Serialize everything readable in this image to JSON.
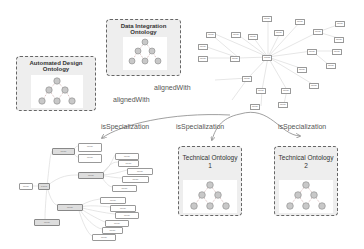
{
  "ontologies": {
    "automated_design": {
      "title": "Automated Design Ontology"
    },
    "data_integration": {
      "title": "Data Integration Ontology"
    },
    "technical_1": {
      "title_line1": "Technical Ontology",
      "title_line2": "1"
    },
    "technical_2": {
      "title_line1": "Technical Ontology",
      "title_line2": "2"
    }
  },
  "relations": {
    "aligned_with_1": "alignedWith",
    "aligned_with_2": "alignedWith",
    "is_specialization_1": "isSpecialization",
    "is_specialization_2": "isSpecialization",
    "is_specialization_3": "isSpecialization"
  },
  "graph": {
    "center": "Thing",
    "nodes": [
      "Node",
      "Node",
      "Node",
      "Node",
      "Node",
      "Node",
      "Node",
      "Node",
      "Node",
      "Node",
      "Node",
      "Node",
      "Node",
      "Node",
      "Node",
      "Node",
      "Node",
      "Node",
      "Node",
      "Node",
      "Node",
      "Node"
    ]
  },
  "tree": {
    "root": "Thing",
    "nodes": [
      "Node",
      "Node",
      "Node",
      "Node",
      "Node",
      "Node",
      "Node",
      "Node",
      "Node",
      "Node",
      "Node",
      "Node",
      "Node",
      "Node",
      "Node",
      "Node",
      "Node",
      "Node"
    ]
  },
  "colors": {
    "box_border": "#666666",
    "box_fill": "#eeeeee",
    "node_fill": "#c8c8c8",
    "line": "#999999"
  }
}
